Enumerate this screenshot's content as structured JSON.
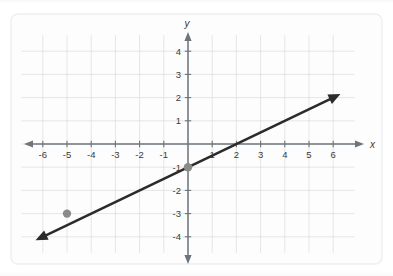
{
  "figure": {
    "kind": "coordinate-plane-graph",
    "background_color": "#ffffff",
    "panel_color": "#fdfdfd",
    "panel_border_color": "#eceff1",
    "grid_color": "#d8dcdf",
    "axis_color": "#6e757a",
    "line_color": "#2b2b2b",
    "point_color": "#8a8a8a",
    "tick_label_color": "#3a3a3a"
  },
  "chart_data": {
    "type": "line",
    "title": "",
    "subtitle": "",
    "xlabel": "x",
    "ylabel": "y",
    "xlim": [
      -6.8,
      6.8
    ],
    "ylim": [
      -4.6,
      4.6
    ],
    "grid": true,
    "legend": "none",
    "x_ticks": [
      -6,
      -5,
      -4,
      -3,
      -2,
      -1,
      1,
      2,
      3,
      4,
      5,
      6
    ],
    "y_ticks": [
      4,
      3,
      2,
      1,
      -1,
      -2,
      -3,
      -4
    ],
    "x_tick_labels": [
      "-6",
      "-5",
      "-4",
      "-3",
      "-2",
      "-1",
      "1",
      "2",
      "3",
      "4",
      "5",
      "6"
    ],
    "y_tick_labels": [
      "4",
      "3",
      "2",
      "1",
      "-1",
      "-2",
      "-3",
      "-4"
    ],
    "axis_arrows": [
      "left",
      "right",
      "up",
      "down"
    ],
    "series": [
      {
        "name": "line",
        "type": "line",
        "slope": 0.5,
        "intercept": -1,
        "equation": "y = 0.5x - 1",
        "x_intercept": 2,
        "y_intercept": -1,
        "arrowheads": [
          "start",
          "end"
        ],
        "x": [
          -6.3,
          6.3
        ],
        "values": [
          -4.15,
          2.15
        ]
      }
    ],
    "points": [
      {
        "name": "point-a",
        "x": -5,
        "y": -3,
        "label": ""
      },
      {
        "name": "point-b",
        "x": 0,
        "y": -1,
        "label": ""
      }
    ],
    "annotations": []
  }
}
